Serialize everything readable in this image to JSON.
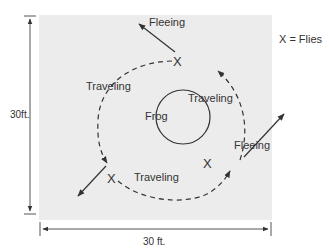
{
  "diagram": {
    "area": {
      "width_label": "30 ft.",
      "height_label": "30ft.",
      "fill": "#ececec"
    },
    "legend": {
      "text": "X = Flies"
    },
    "center": {
      "label": "Frog"
    },
    "path_labels": [
      {
        "id": "travel-left",
        "text": "Traveling"
      },
      {
        "id": "travel-right",
        "text": "Traveling"
      },
      {
        "id": "travel-bottom",
        "text": "Traveling"
      }
    ],
    "flee_labels": [
      {
        "id": "flee-top",
        "text": "Fleeing"
      },
      {
        "id": "flee-right",
        "text": "Fleeing"
      }
    ],
    "fly_marker": "X"
  }
}
